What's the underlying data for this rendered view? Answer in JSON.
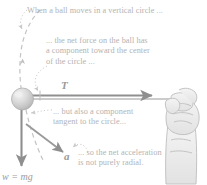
{
  "figure": {
    "title_hidden": "",
    "callouts": {
      "vertical_circle": "When a ball moves in a vertical circle ...",
      "net_force": "... the net force on the ball has\na component toward the center\nof the circle ...",
      "tangent": "... but also a component\ntangent to the circle...",
      "radial": "... so the net acceleration\nis not purely radial."
    },
    "vectors": {
      "tension_label": "T",
      "acceleration_label": "a",
      "weight_label": "w = mg"
    },
    "icons": {
      "ball": "ball-sphere-icon",
      "hand": "hand-gripping-icon",
      "circle_path": "dashed-circle-path-icon"
    },
    "colors": {
      "text": "#b3b3b3",
      "vector": "#8f8f8f",
      "ball_fill": "#cfcfcf",
      "ball_highlight": "#eeeeee",
      "dashed": "#c4c4c4",
      "hand_outline": "#bdbdbd"
    }
  }
}
